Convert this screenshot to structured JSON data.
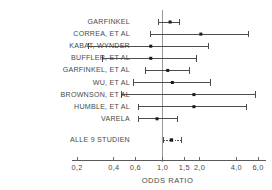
{
  "chart_data": {
    "type": "scatter",
    "subtype": "forest-plot",
    "title": "",
    "xlabel": "ODDS RATIO",
    "ylabel": "",
    "xscale": "log",
    "xlim": [
      0.2,
      6.0
    ],
    "grid": false,
    "reference_line": 1.0,
    "tick_values": [
      0.2,
      0.4,
      0.6,
      1.0,
      1.5,
      2.0,
      4.0,
      6.0
    ],
    "tick_labels": [
      "0,2",
      "0,4",
      "0,6",
      "1,0",
      "1,5",
      "2,0",
      "4,0",
      "6,0"
    ],
    "categories": [
      "GARFINKEL",
      "CORREA, ET AL",
      "KABAT, WYNDER",
      "BUFFLER, ET AL",
      "GARFINKEL, ET AL",
      "WU, ET AL",
      "BROWNSON, ET AL",
      "HUMBLE, ET AL",
      "VARELA",
      "ALLE 9 STUDIEN"
    ],
    "points": [
      {
        "label": "GARFINKEL",
        "value": 1.15,
        "low": 0.93,
        "high": 1.38,
        "summary": false
      },
      {
        "label": "CORREA, ET AL",
        "value": 2.05,
        "low": 0.8,
        "high": 5.0,
        "summary": false
      },
      {
        "label": "KABAT, WYNDER",
        "value": 0.8,
        "low": 0.25,
        "high": 2.35,
        "summary": false
      },
      {
        "label": "BUFFLER, ET AL",
        "value": 0.8,
        "low": 0.32,
        "high": 1.9,
        "summary": false
      },
      {
        "label": "GARFINKEL, ET AL",
        "value": 1.1,
        "low": 0.72,
        "high": 1.65,
        "summary": false
      },
      {
        "label": "WU, ET AL",
        "value": 1.2,
        "low": 0.58,
        "high": 2.45,
        "summary": false
      },
      {
        "label": "BROWNSON, ET AL",
        "value": 1.8,
        "low": 0.46,
        "high": 5.7,
        "summary": false
      },
      {
        "label": "HUMBLE, ET AL",
        "value": 1.8,
        "low": 0.63,
        "high": 4.8,
        "summary": false
      },
      {
        "label": "VARELA",
        "value": 0.9,
        "low": 0.64,
        "high": 1.32,
        "summary": false
      },
      {
        "label": "ALLE 9 STUDIEN",
        "value": 1.18,
        "low": 1.02,
        "high": 1.42,
        "summary": true
      }
    ],
    "colors": {
      "marker": "#1a1a1a",
      "whisker": "#3a3a3a",
      "axis": "#5a5a5a",
      "reference": "#8d8d8d",
      "text": "#4a4a4a"
    }
  },
  "axis_title": "ODDS RATIO"
}
